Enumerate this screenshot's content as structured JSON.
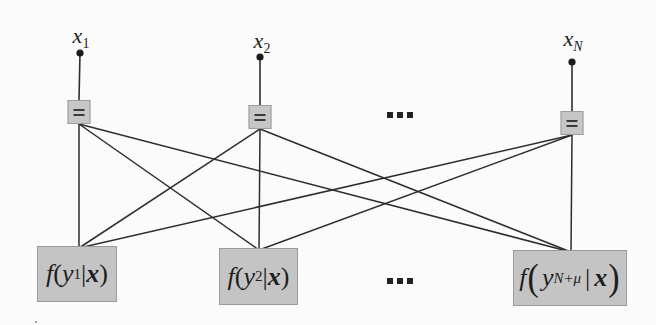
{
  "diagram": {
    "type": "factor-graph",
    "colors": {
      "background": "#fbfbfb",
      "node_fill": "#c5c5c5",
      "node_border": "#9c9c9c",
      "edge": "#2e2e2e",
      "text": "#1e1e1e"
    },
    "variables": [
      {
        "id": "x1",
        "name": "x",
        "subscript": "1",
        "dot": [
          80,
          53
        ],
        "eq_node": [
          79,
          112
        ]
      },
      {
        "id": "x2",
        "name": "x",
        "subscript": "2",
        "dot": [
          260,
          57
        ],
        "eq_node": [
          260,
          117
        ]
      },
      {
        "id": "xN",
        "name": "x",
        "subscript": "N",
        "dot": [
          572,
          62
        ],
        "eq_node": [
          572,
          123
        ]
      }
    ],
    "equality_symbol": "=",
    "factors": [
      {
        "id": "f1",
        "fn": "f",
        "var": "y",
        "subscript": "1",
        "given": "x",
        "label": "f(y1|x)",
        "box": [
          37,
          246,
          80,
          56
        ],
        "anchor": [
          79,
          248
        ]
      },
      {
        "id": "f2",
        "fn": "f",
        "var": "y",
        "subscript": "2",
        "given": "x",
        "label": "f(y2|x)",
        "box": [
          219,
          248,
          79,
          57
        ],
        "anchor": [
          259,
          250
        ]
      },
      {
        "id": "fN",
        "fn": "f",
        "var": "y",
        "subscript": "N+μ",
        "given": "x",
        "label": "f(y_{N+μ} | x)",
        "box": [
          513,
          250,
          114,
          56
        ],
        "anchor": [
          571,
          252
        ]
      }
    ],
    "edges": [
      {
        "from": "x1",
        "to": "f1"
      },
      {
        "from": "x1",
        "to": "f2"
      },
      {
        "from": "x1",
        "to": "fN"
      },
      {
        "from": "x2",
        "to": "f1"
      },
      {
        "from": "x2",
        "to": "f2"
      },
      {
        "from": "x2",
        "to": "fN"
      },
      {
        "from": "xN",
        "to": "f1"
      },
      {
        "from": "xN",
        "to": "f2"
      },
      {
        "from": "xN",
        "to": "fN"
      }
    ],
    "ellipses": [
      {
        "id": "top-ellipsis",
        "text": "...",
        "pos": [
          386,
          112
        ]
      },
      {
        "id": "bottom-ellipsis",
        "text": "...",
        "pos": [
          386,
          278
        ]
      }
    ]
  },
  "labels": {
    "x1": {
      "base": "x",
      "sub": "1"
    },
    "x2": {
      "base": "x",
      "sub": "2"
    },
    "xN": {
      "base": "x",
      "sub": "N"
    },
    "f1": {
      "fn": "f",
      "open": "(",
      "var": "y",
      "sub": "1",
      "bar": "|",
      "given": "x",
      "close": ")"
    },
    "f2": {
      "fn": "f",
      "open": "(",
      "var": "y",
      "sub": "2",
      "bar": "|",
      "given": "x",
      "close": ")"
    },
    "fN": {
      "fn": "f",
      "open": "(",
      "var": "y",
      "sub": "N+μ",
      "bar": "|",
      "given": "x",
      "close": ")"
    },
    "eq": "="
  }
}
